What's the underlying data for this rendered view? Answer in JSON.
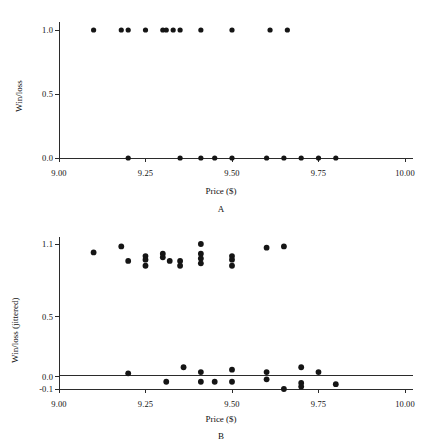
{
  "figure": {
    "panels": [
      {
        "id": "A",
        "label": "A",
        "xlabel": "Price ($)",
        "ylabel": "Win/loss",
        "xticks": [
          "9.00",
          "9.25",
          "9.50",
          "9.75",
          "10.00"
        ],
        "yticks": [
          "0.0",
          "0.5",
          "1.0"
        ]
      },
      {
        "id": "B",
        "label": "B",
        "xlabel": "Price ($)",
        "ylabel": "Win/loss (jittered)",
        "xticks": [
          "9.00",
          "9.25",
          "9.50",
          "9.75",
          "10.00"
        ],
        "yticks": [
          "-0.1",
          "0.0",
          "0.5",
          "1.1"
        ]
      }
    ]
  },
  "chart_data": [
    {
      "type": "scatter",
      "panel": "A",
      "title": "A",
      "xlabel": "Price ($)",
      "ylabel": "Win/loss",
      "xlim": [
        9.0,
        10.0
      ],
      "ylim": [
        0.0,
        1.0
      ],
      "xticks": [
        9.0,
        9.25,
        9.5,
        9.75,
        10.0
      ],
      "yticks": [
        0.0,
        0.5,
        1.0
      ],
      "grid": false,
      "legend": null,
      "marker": "filled-circle",
      "color": "#151515",
      "points": [
        {
          "x": 9.1,
          "y": 1.0
        },
        {
          "x": 9.18,
          "y": 1.0
        },
        {
          "x": 9.2,
          "y": 1.0
        },
        {
          "x": 9.25,
          "y": 1.0
        },
        {
          "x": 9.3,
          "y": 1.0
        },
        {
          "x": 9.31,
          "y": 1.0
        },
        {
          "x": 9.33,
          "y": 1.0
        },
        {
          "x": 9.35,
          "y": 1.0
        },
        {
          "x": 9.41,
          "y": 1.0
        },
        {
          "x": 9.5,
          "y": 1.0
        },
        {
          "x": 9.61,
          "y": 1.0
        },
        {
          "x": 9.66,
          "y": 1.0
        },
        {
          "x": 9.2,
          "y": 0.0
        },
        {
          "x": 9.35,
          "y": 0.0
        },
        {
          "x": 9.41,
          "y": 0.0
        },
        {
          "x": 9.45,
          "y": 0.0
        },
        {
          "x": 9.5,
          "y": 0.0
        },
        {
          "x": 9.6,
          "y": 0.0
        },
        {
          "x": 9.65,
          "y": 0.0
        },
        {
          "x": 9.7,
          "y": 0.0
        },
        {
          "x": 9.75,
          "y": 0.0
        },
        {
          "x": 9.8,
          "y": 0.0
        }
      ]
    },
    {
      "type": "scatter",
      "panel": "B",
      "title": "B",
      "xlabel": "Price ($)",
      "ylabel": "Win/loss (jittered)",
      "xlim": [
        9.0,
        10.0
      ],
      "ylim": [
        -0.1,
        1.1
      ],
      "xticks": [
        9.0,
        9.25,
        9.5,
        9.75,
        10.0
      ],
      "yticks": [
        -0.1,
        0.0,
        0.5,
        1.1
      ],
      "grid": false,
      "legend": null,
      "marker": "filled-circle",
      "color": "#151515",
      "note": "Same binary outcomes as panel A with vertical jitter applied to reveal overlapping observations",
      "points": [
        {
          "x": 9.1,
          "y": 1.03
        },
        {
          "x": 9.18,
          "y": 1.08
        },
        {
          "x": 9.2,
          "y": 0.96
        },
        {
          "x": 9.25,
          "y": 1.0
        },
        {
          "x": 9.25,
          "y": 0.97
        },
        {
          "x": 9.25,
          "y": 0.92
        },
        {
          "x": 9.3,
          "y": 1.02
        },
        {
          "x": 9.3,
          "y": 0.99
        },
        {
          "x": 9.32,
          "y": 0.96
        },
        {
          "x": 9.35,
          "y": 0.96
        },
        {
          "x": 9.35,
          "y": 0.92
        },
        {
          "x": 9.41,
          "y": 1.1
        },
        {
          "x": 9.41,
          "y": 1.02
        },
        {
          "x": 9.41,
          "y": 0.98
        },
        {
          "x": 9.41,
          "y": 0.94
        },
        {
          "x": 9.5,
          "y": 1.0
        },
        {
          "x": 9.5,
          "y": 0.97
        },
        {
          "x": 9.5,
          "y": 0.92
        },
        {
          "x": 9.6,
          "y": 1.07
        },
        {
          "x": 9.65,
          "y": 1.08
        },
        {
          "x": 9.2,
          "y": 0.03
        },
        {
          "x": 9.31,
          "y": -0.04
        },
        {
          "x": 9.36,
          "y": 0.08
        },
        {
          "x": 9.41,
          "y": 0.04
        },
        {
          "x": 9.41,
          "y": -0.04
        },
        {
          "x": 9.45,
          "y": -0.04
        },
        {
          "x": 9.5,
          "y": 0.06
        },
        {
          "x": 9.5,
          "y": -0.04
        },
        {
          "x": 9.6,
          "y": 0.04
        },
        {
          "x": 9.6,
          "y": -0.02
        },
        {
          "x": 9.65,
          "y": -0.1
        },
        {
          "x": 9.7,
          "y": 0.08
        },
        {
          "x": 9.7,
          "y": -0.05
        },
        {
          "x": 9.7,
          "y": -0.08
        },
        {
          "x": 9.75,
          "y": 0.04
        },
        {
          "x": 9.8,
          "y": -0.06
        }
      ]
    }
  ]
}
